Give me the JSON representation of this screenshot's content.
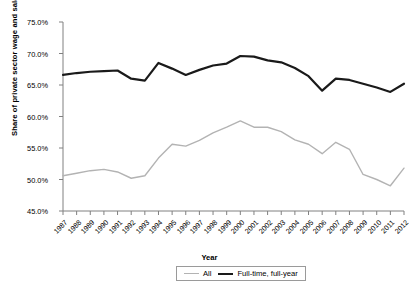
{
  "chart_data": {
    "type": "line",
    "title": "",
    "xlabel": "Year",
    "ylabel": "Share of private sector wage and salary workers",
    "xlim": [
      1987,
      2012
    ],
    "ylim": [
      45.0,
      75.0
    ],
    "ytick_values": [
      45.0,
      50.0,
      55.0,
      60.0,
      65.0,
      70.0,
      75.0
    ],
    "ytick_labels": [
      "45.0%",
      "50.0%",
      "55.0%",
      "60.0%",
      "65.0%",
      "70.0%",
      "75.0%"
    ],
    "grid": false,
    "legend_position": "bottom-center",
    "x": [
      1987,
      1988,
      1989,
      1990,
      1991,
      1992,
      1993,
      1994,
      1995,
      1996,
      1997,
      1998,
      1999,
      2000,
      2001,
      2002,
      2003,
      2004,
      2005,
      2006,
      2007,
      2008,
      2009,
      2010,
      2011,
      2012
    ],
    "categories": [
      "1987",
      "1988",
      "1989",
      "1990",
      "1991",
      "1992",
      "1993",
      "1994",
      "1995",
      "1996",
      "1997",
      "1998",
      "1999",
      "2000",
      "2001",
      "2002",
      "2003",
      "2004",
      "2005",
      "2006",
      "2007",
      "2008",
      "2009",
      "2010",
      "2011",
      "2012"
    ],
    "series": [
      {
        "name": "All",
        "color": "#b3b3b3",
        "width": 1.4,
        "values": [
          50.6,
          51.0,
          51.4,
          51.6,
          51.2,
          50.2,
          50.6,
          53.4,
          55.6,
          55.3,
          56.2,
          57.4,
          58.3,
          59.3,
          58.3,
          58.3,
          57.6,
          56.3,
          55.6,
          54.1,
          55.9,
          54.8,
          50.8,
          50.0,
          49.0,
          51.8
        ]
      },
      {
        "name": "Full-time, full-year",
        "color": "#1a1a1a",
        "width": 2.2,
        "values": [
          66.6,
          66.9,
          67.1,
          67.2,
          67.3,
          66.0,
          65.7,
          68.5,
          67.6,
          66.6,
          67.4,
          68.1,
          68.4,
          69.6,
          69.5,
          68.9,
          68.6,
          67.7,
          66.4,
          64.1,
          66.0,
          65.8,
          65.2,
          64.6,
          63.9,
          65.2
        ]
      }
    ],
    "legend_entries": [
      "All",
      "Full-time, full-year"
    ]
  },
  "axis": {
    "x_title": "Year",
    "y_title": "Share of private sector wage and salary workers"
  }
}
